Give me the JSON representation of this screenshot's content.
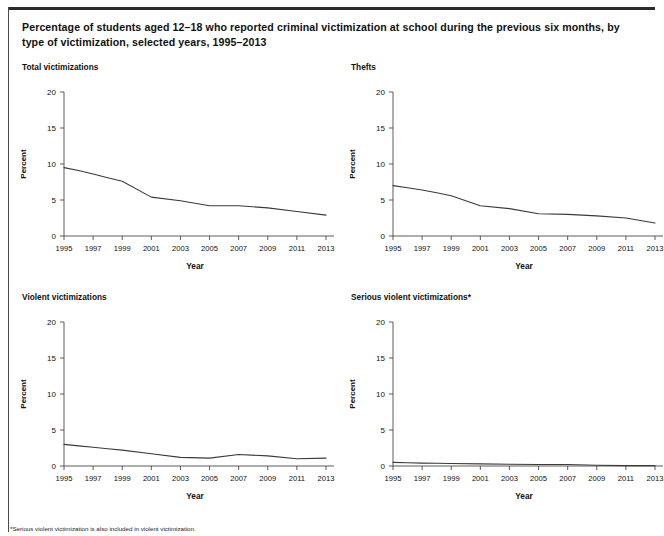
{
  "figure": {
    "title": "Percentage of students aged 12–18 who reported criminal victimization at school during the previous six months, by type of victimization, selected years, 1995–2013",
    "footnote": "*Serious violent victimization is also included in violent victimization.",
    "line_color": "#3a3a3a",
    "axis_color": "#4a4a4a",
    "text_color": "#111111"
  },
  "chart_data": [
    {
      "type": "line",
      "title": "Total victimizations",
      "xlabel": "Year",
      "ylabel": "Percent",
      "ylim": [
        0,
        20
      ],
      "yticks": [
        0,
        5,
        10,
        15,
        20
      ],
      "ytick_labels": [
        "0",
        "5",
        "10",
        "15",
        "20"
      ],
      "xlim": [
        1995,
        2013
      ],
      "xticks": [
        1995,
        1997,
        1999,
        2001,
        2003,
        2005,
        2007,
        2009,
        2011,
        2013
      ],
      "xtick_labels": [
        "1995",
        "1997",
        "1999",
        "2001",
        "2003",
        "2005",
        "2007",
        "2009",
        "2011",
        "2013"
      ],
      "grid": false,
      "legend": "none",
      "x": [
        1995,
        1996,
        1997,
        1998,
        1999,
        2001,
        2003,
        2005,
        2007,
        2009,
        2011,
        2013
      ],
      "values": [
        9.5,
        9.1,
        8.6,
        8.1,
        7.6,
        5.4,
        4.9,
        4.2,
        4.2,
        3.9,
        3.4,
        2.9
      ]
    },
    {
      "type": "line",
      "title": "Thefts",
      "xlabel": "Year",
      "ylabel": "Percent",
      "ylim": [
        0,
        20
      ],
      "yticks": [
        0,
        5,
        10,
        15,
        20
      ],
      "ytick_labels": [
        "0",
        "5",
        "10",
        "15",
        "20"
      ],
      "xlim": [
        1995,
        2013
      ],
      "xticks": [
        1995,
        1997,
        1999,
        2001,
        2003,
        2005,
        2007,
        2009,
        2011,
        2013
      ],
      "xtick_labels": [
        "1995",
        "1997",
        "1999",
        "2001",
        "2003",
        "2005",
        "2007",
        "2009",
        "2011",
        "2013"
      ],
      "grid": false,
      "legend": "none",
      "x": [
        1995,
        1996,
        1997,
        1998,
        1999,
        2001,
        2003,
        2005,
        2007,
        2009,
        2011,
        2013
      ],
      "values": [
        7.0,
        6.7,
        6.4,
        6.0,
        5.6,
        4.2,
        3.8,
        3.1,
        3.0,
        2.8,
        2.5,
        1.8
      ]
    },
    {
      "type": "line",
      "title": "Violent victimizations",
      "xlabel": "Year",
      "ylabel": "Percent",
      "ylim": [
        0,
        20
      ],
      "yticks": [
        0,
        5,
        10,
        15,
        20
      ],
      "ytick_labels": [
        "0",
        "5",
        "10",
        "15",
        "20"
      ],
      "xlim": [
        1995,
        2013
      ],
      "xticks": [
        1995,
        1997,
        1999,
        2001,
        2003,
        2005,
        2007,
        2009,
        2011,
        2013
      ],
      "xtick_labels": [
        "1995",
        "1997",
        "1999",
        "2001",
        "2003",
        "2005",
        "2007",
        "2009",
        "2011",
        "2013"
      ],
      "grid": false,
      "legend": "none",
      "x": [
        1995,
        1996,
        1997,
        1998,
        1999,
        2001,
        2003,
        2005,
        2007,
        2009,
        2011,
        2013
      ],
      "values": [
        3.0,
        2.8,
        2.6,
        2.4,
        2.2,
        1.7,
        1.2,
        1.1,
        1.6,
        1.4,
        1.0,
        1.1
      ]
    },
    {
      "type": "line",
      "title": "Serious violent victimizations*",
      "xlabel": "Year",
      "ylabel": "Percent",
      "ylim": [
        0,
        20
      ],
      "yticks": [
        0,
        5,
        10,
        15,
        20
      ],
      "ytick_labels": [
        "0",
        "5",
        "10",
        "15",
        "20"
      ],
      "xlim": [
        1995,
        2013
      ],
      "xticks": [
        1995,
        1997,
        1999,
        2001,
        2003,
        2005,
        2007,
        2009,
        2011,
        2013
      ],
      "xtick_labels": [
        "1995",
        "1997",
        "1999",
        "2001",
        "2003",
        "2005",
        "2007",
        "2009",
        "2011",
        "2013"
      ],
      "grid": false,
      "legend": "none",
      "x": [
        1995,
        1996,
        1997,
        1998,
        1999,
        2001,
        2003,
        2005,
        2007,
        2009,
        2011,
        2013
      ],
      "values": [
        0.5,
        0.45,
        0.4,
        0.38,
        0.35,
        0.3,
        0.25,
        0.2,
        0.2,
        0.1,
        0.05,
        0.05
      ]
    }
  ]
}
